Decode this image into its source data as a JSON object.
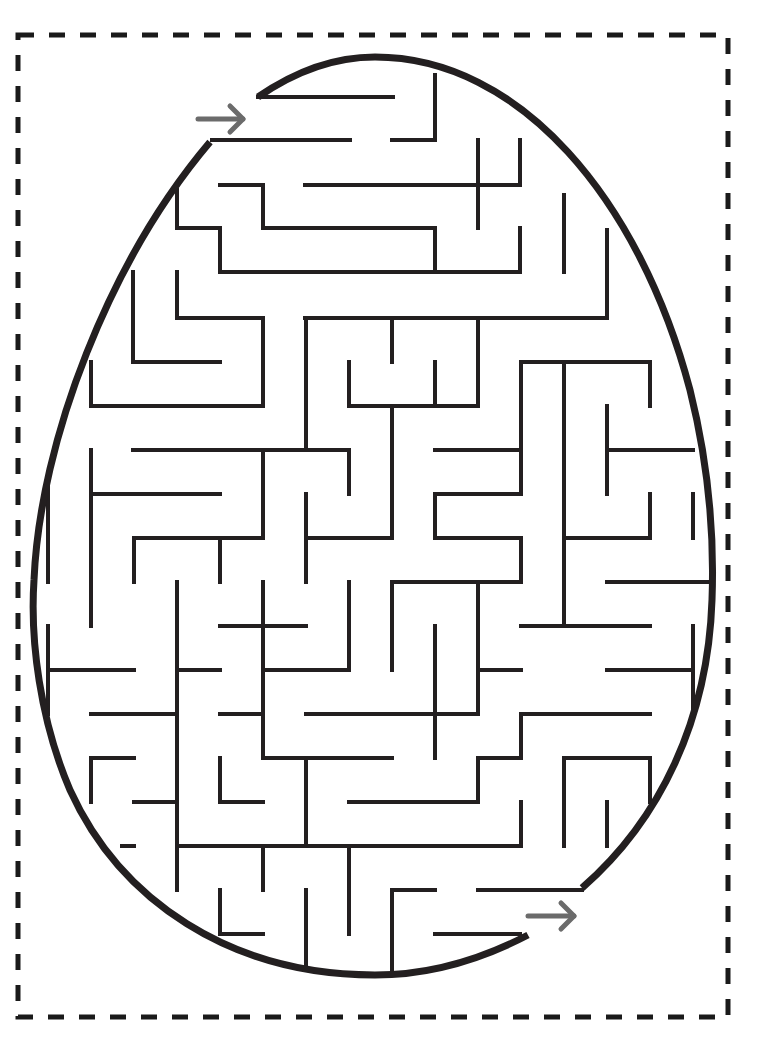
{
  "colors": {
    "background": "#ffffff",
    "wall": "#231f20",
    "arrow": "#6b6b6b",
    "cut_border": "#1a1a1a"
  },
  "cut_border": {
    "x": 18,
    "y": 35,
    "width": 710,
    "height": 982,
    "dash": "16 15",
    "stroke_width": 5
  },
  "egg_outline": {
    "path": "M 258 97 C 300 68 340 57 375 57 C 520 57 640 200 690 390 C 705 450 715 520 712 600 C 708 720 660 820 582 888 M 528 935 C 480 960 430 975 375 975 C 230 975 120 900 70 790 C 40 720 30 640 34 580 C 40 440 110 260 210 142",
    "stroke_width": 7
  },
  "start_arrow": {
    "label": "start",
    "x1": 198,
    "y1": 119,
    "x2": 243,
    "y2": 119
  },
  "end_arrow": {
    "label": "finish",
    "x1": 528,
    "y1": 916,
    "x2": 574,
    "y2": 916
  },
  "walls": [
    [
      258,
      97,
      393,
      97
    ],
    [
      435,
      75,
      435,
      140
    ],
    [
      392,
      140,
      435,
      140
    ],
    [
      212,
      140,
      350,
      140
    ],
    [
      220,
      185,
      263,
      185
    ],
    [
      263,
      185,
      263,
      228
    ],
    [
      263,
      228,
      435,
      228
    ],
    [
      305,
      185,
      520,
      185
    ],
    [
      520,
      140,
      520,
      185
    ],
    [
      478,
      140,
      478,
      228
    ],
    [
      177,
      190,
      177,
      228
    ],
    [
      177,
      228,
      220,
      228
    ],
    [
      220,
      228,
      220,
      272
    ],
    [
      220,
      272,
      520,
      272
    ],
    [
      435,
      228,
      435,
      272
    ],
    [
      520,
      228,
      520,
      272
    ],
    [
      564,
      195,
      564,
      272
    ],
    [
      607,
      230,
      607,
      318
    ],
    [
      305,
      318,
      607,
      318
    ],
    [
      133,
      272,
      133,
      362
    ],
    [
      133,
      362,
      220,
      362
    ],
    [
      177,
      272,
      177,
      318
    ],
    [
      177,
      318,
      263,
      318
    ],
    [
      263,
      318,
      263,
      406
    ],
    [
      91,
      362,
      91,
      406
    ],
    [
      91,
      406,
      263,
      406
    ],
    [
      306,
      318,
      306,
      450
    ],
    [
      392,
      318,
      392,
      362
    ],
    [
      349,
      362,
      349,
      406
    ],
    [
      349,
      406,
      478,
      406
    ],
    [
      435,
      362,
      435,
      406
    ],
    [
      478,
      318,
      478,
      406
    ],
    [
      521,
      362,
      650,
      362
    ],
    [
      521,
      362,
      521,
      494
    ],
    [
      564,
      362,
      564,
      626
    ],
    [
      650,
      362,
      650,
      406
    ],
    [
      607,
      406,
      607,
      494
    ],
    [
      607,
      450,
      693,
      450
    ],
    [
      650,
      494,
      650,
      538
    ],
    [
      564,
      538,
      650,
      538
    ],
    [
      693,
      494,
      693,
      538
    ],
    [
      133,
      450,
      349,
      450
    ],
    [
      349,
      450,
      349,
      494
    ],
    [
      306,
      450,
      306,
      450
    ],
    [
      263,
      450,
      263,
      538
    ],
    [
      91,
      450,
      91,
      626
    ],
    [
      91,
      494,
      220,
      494
    ],
    [
      134,
      538,
      263,
      538
    ],
    [
      134,
      538,
      134,
      582
    ],
    [
      220,
      538,
      220,
      582
    ],
    [
      392,
      406,
      392,
      538
    ],
    [
      306,
      494,
      306,
      582
    ],
    [
      306,
      538,
      392,
      538
    ],
    [
      435,
      450,
      521,
      450
    ],
    [
      435,
      494,
      521,
      494
    ],
    [
      435,
      494,
      435,
      538
    ],
    [
      435,
      538,
      521,
      538
    ],
    [
      521,
      538,
      521,
      582
    ],
    [
      392,
      582,
      521,
      582
    ],
    [
      607,
      582,
      707,
      582
    ],
    [
      48,
      482,
      48,
      582
    ],
    [
      177,
      582,
      177,
      890
    ],
    [
      263,
      582,
      263,
      670
    ],
    [
      220,
      626,
      306,
      626
    ],
    [
      349,
      582,
      349,
      670
    ],
    [
      263,
      670,
      349,
      670
    ],
    [
      392,
      582,
      392,
      670
    ],
    [
      435,
      626,
      435,
      758
    ],
    [
      478,
      582,
      478,
      714
    ],
    [
      478,
      670,
      521,
      670
    ],
    [
      521,
      626,
      650,
      626
    ],
    [
      607,
      670,
      693,
      670
    ],
    [
      693,
      626,
      693,
      714
    ],
    [
      48,
      626,
      48,
      714
    ],
    [
      48,
      670,
      134,
      670
    ],
    [
      177,
      670,
      220,
      670
    ],
    [
      91,
      714,
      177,
      714
    ],
    [
      220,
      714,
      263,
      714
    ],
    [
      263,
      582,
      263,
      758
    ],
    [
      263,
      758,
      392,
      758
    ],
    [
      306,
      714,
      478,
      714
    ],
    [
      392,
      714,
      392,
      714
    ],
    [
      521,
      714,
      650,
      714
    ],
    [
      521,
      714,
      521,
      758
    ],
    [
      478,
      758,
      521,
      758
    ],
    [
      478,
      758,
      478,
      802
    ],
    [
      91,
      758,
      134,
      758
    ],
    [
      91,
      758,
      91,
      802
    ],
    [
      134,
      802,
      177,
      802
    ],
    [
      220,
      758,
      220,
      802
    ],
    [
      220,
      802,
      263,
      802
    ],
    [
      306,
      758,
      306,
      846
    ],
    [
      349,
      802,
      478,
      802
    ],
    [
      521,
      802,
      521,
      846
    ],
    [
      564,
      758,
      650,
      758
    ],
    [
      564,
      758,
      564,
      846
    ],
    [
      607,
      802,
      607,
      846
    ],
    [
      650,
      758,
      650,
      802
    ],
    [
      177,
      846,
      521,
      846
    ],
    [
      122,
      846,
      134,
      846
    ],
    [
      263,
      846,
      263,
      890
    ],
    [
      220,
      890,
      220,
      930
    ],
    [
      220,
      934,
      263,
      934
    ],
    [
      306,
      890,
      306,
      965
    ],
    [
      349,
      846,
      349,
      934
    ],
    [
      392,
      890,
      435,
      890
    ],
    [
      392,
      890,
      392,
      972
    ],
    [
      435,
      934,
      520,
      934
    ],
    [
      478,
      890,
      582,
      890
    ]
  ]
}
